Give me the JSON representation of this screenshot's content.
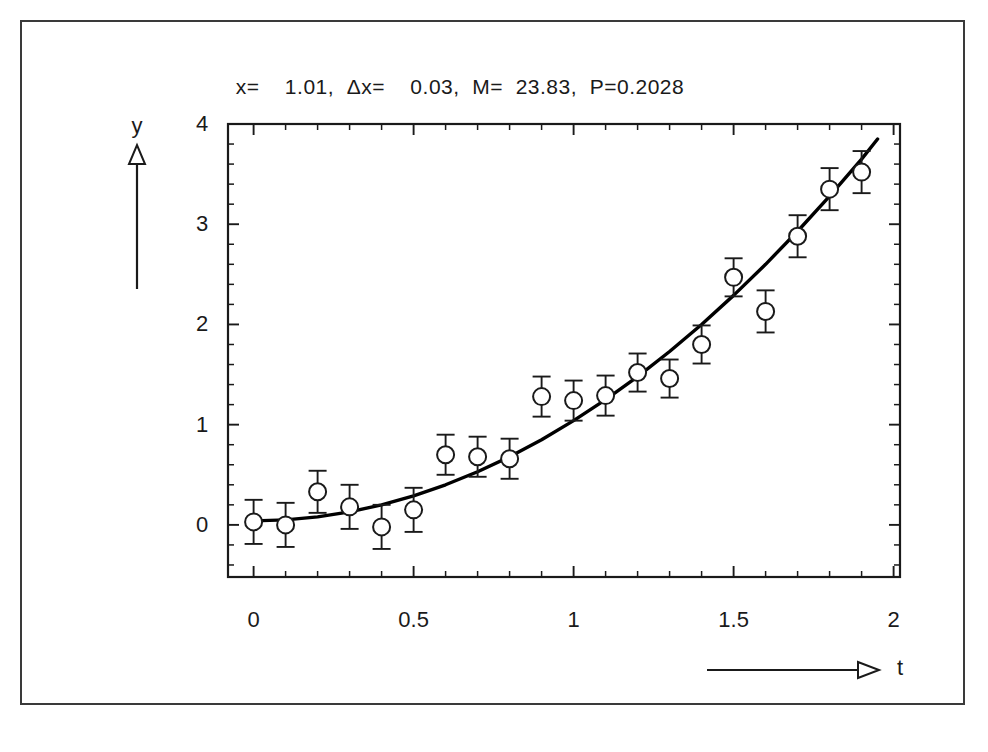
{
  "figure": {
    "title": "x=    1.01,  Δx=    0.03,  M=  23.83,  P=0.2028",
    "title_parts": {
      "x_label": "x=",
      "x_value": "1.01,",
      "dx_label": "Δx=",
      "dx_value": "0.03,",
      "m_label": "M=",
      "m_value": "23.83,",
      "p_label": "P=0.2028"
    },
    "axis_color": "#1a1a1a",
    "curve_color": "#000000",
    "marker_color": "#ffffff",
    "marker_stroke": "#1a1a1a"
  },
  "axes": {
    "x_axis_name": "t",
    "y_axis_name": "y",
    "x_ticklabels": [
      "0",
      "0.5",
      "1",
      "1.5",
      "2"
    ],
    "x_tickvalues": [
      0,
      0.5,
      1,
      1.5,
      2
    ],
    "y_ticklabels": [
      "0",
      "1",
      "2",
      "3",
      "4"
    ],
    "y_tickvalues": [
      0,
      1,
      2,
      3,
      4
    ]
  },
  "chart_data": {
    "type": "scatter",
    "title": "x=    1.01,  Δx=    0.03,  M=  23.83,  P=0.2028",
    "xlabel": "t",
    "ylabel": "y",
    "xlim": [
      -0.08,
      2.02
    ],
    "ylim": [
      -0.52,
      4.0
    ],
    "grid": false,
    "legend": "none",
    "x_major_ticks": [
      0,
      0.5,
      1,
      1.5,
      2
    ],
    "x_minor_tick_step": 0.1,
    "y_major_ticks": [
      0,
      1,
      2,
      3,
      4
    ],
    "y_minor_tick_step": 0.2,
    "series": [
      {
        "name": "measurements",
        "type": "scatter_with_errorbars",
        "marker": "open-circle",
        "x": [
          0.0,
          0.1,
          0.2,
          0.3,
          0.4,
          0.5,
          0.6,
          0.7,
          0.8,
          0.9,
          1.0,
          1.1,
          1.2,
          1.3,
          1.4,
          1.5,
          1.6,
          1.7,
          1.8,
          1.9
        ],
        "y": [
          0.03,
          0.0,
          0.33,
          0.18,
          -0.02,
          0.15,
          0.7,
          0.68,
          0.66,
          1.28,
          1.24,
          1.29,
          1.52,
          1.46,
          1.8,
          2.47,
          2.13,
          2.88,
          3.35,
          3.52
        ],
        "yerr": [
          0.22,
          0.22,
          0.21,
          0.22,
          0.22,
          0.22,
          0.2,
          0.2,
          0.2,
          0.2,
          0.2,
          0.2,
          0.19,
          0.19,
          0.19,
          0.19,
          0.21,
          0.21,
          0.21,
          0.21
        ]
      },
      {
        "name": "fit",
        "type": "line",
        "description": "fitted smooth curve through data",
        "x": [
          0.0,
          0.1,
          0.2,
          0.3,
          0.4,
          0.5,
          0.6,
          0.7,
          0.8,
          0.9,
          1.0,
          1.1,
          1.2,
          1.3,
          1.4,
          1.5,
          1.6,
          1.7,
          1.8,
          1.9,
          1.95
        ],
        "y": [
          0.04,
          0.05,
          0.08,
          0.13,
          0.2,
          0.29,
          0.4,
          0.53,
          0.68,
          0.85,
          1.04,
          1.25,
          1.48,
          1.73,
          2.0,
          2.29,
          2.6,
          2.93,
          3.28,
          3.65,
          3.85
        ]
      }
    ]
  }
}
